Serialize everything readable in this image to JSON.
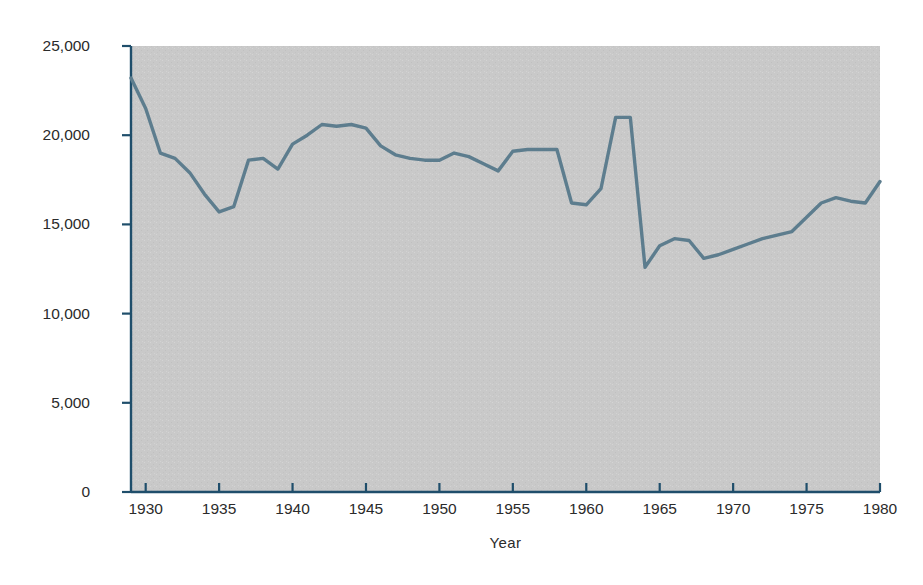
{
  "chart_data": {
    "type": "line",
    "title": "",
    "xlabel": "Year",
    "ylabel": "Number of movie theaters",
    "xlim": [
      1929,
      1980
    ],
    "ylim": [
      0,
      25000
    ],
    "xticks": [
      1930,
      1935,
      1940,
      1945,
      1950,
      1955,
      1960,
      1965,
      1970,
      1975,
      1980
    ],
    "xtick_labels": [
      "1930",
      "1935",
      "1940",
      "1945",
      "1950",
      "1955",
      "1960",
      "1965",
      "1970",
      "1975",
      "1980"
    ],
    "yticks": [
      0,
      5000,
      10000,
      15000,
      20000,
      25000
    ],
    "ytick_labels": [
      "0",
      "5,000",
      "10,000",
      "15,000",
      "20,000",
      "25,000"
    ],
    "grid": false,
    "legend": false,
    "line_color": "#5d7d8e",
    "plot_background": "#c9c9c9",
    "figure_background": "#ffffff",
    "axis_color": "#1f4e6b",
    "series": [
      {
        "name": "Number of movie theaters",
        "x": [
          1929,
          1930,
          1931,
          1932,
          1933,
          1934,
          1935,
          1936,
          1937,
          1938,
          1939,
          1940,
          1941,
          1942,
          1943,
          1944,
          1945,
          1946,
          1947,
          1948,
          1949,
          1950,
          1951,
          1952,
          1953,
          1954,
          1955,
          1956,
          1957,
          1958,
          1959,
          1960,
          1961,
          1962,
          1963,
          1964,
          1965,
          1966,
          1967,
          1968,
          1969,
          1970,
          1971,
          1972,
          1973,
          1974,
          1975,
          1976,
          1977,
          1978,
          1979,
          1980
        ],
        "values": [
          23200,
          21500,
          19000,
          18700,
          17900,
          16700,
          15700,
          16000,
          18600,
          18700,
          18100,
          19500,
          20000,
          20600,
          20500,
          20600,
          20400,
          19400,
          18900,
          18700,
          18600,
          18600,
          19000,
          18800,
          18400,
          18000,
          19100,
          19200,
          19200,
          19200,
          16200,
          16100,
          17000,
          21000,
          21000,
          12600,
          13800,
          14200,
          14100,
          13100,
          13300,
          13600,
          13900,
          14200,
          14400,
          14600,
          15400,
          16200,
          16500,
          16300,
          16200,
          17400
        ]
      }
    ]
  }
}
